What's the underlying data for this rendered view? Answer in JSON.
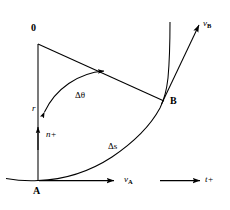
{
  "figure": {
    "background_color": "#ffffff",
    "stroke_color": "#000000",
    "width": 230,
    "height": 210,
    "labels": {
      "origin": "0",
      "point_a": "A",
      "point_b": "B",
      "radius": "r",
      "normal_direction": "n+",
      "tangent_direction": "t+",
      "delta_theta": "Δθ",
      "delta_s": "Δs",
      "velocity_a": "v",
      "velocity_a_sub": "A",
      "velocity_b": "v",
      "velocity_b_sub": "B"
    },
    "geometry": {
      "origin_point": [
        38,
        42
      ],
      "point_a": [
        38,
        180
      ],
      "point_b": [
        165,
        100
      ],
      "radius_line": "O to A (vertical)",
      "second_radius_line": "O to B",
      "arc_delta_theta": "angle at O between OA and OB, double-headed arc",
      "trajectory": "curve from lower-left through A, through B, continuing upward",
      "velocity_a_arrow": "horizontal right from A",
      "velocity_b_arrow": "tangent to curve at B, up-right",
      "normal_arrow": "upward along AO at A",
      "tangent_reference_arrow": "horizontal right, detached, lower right"
    }
  }
}
